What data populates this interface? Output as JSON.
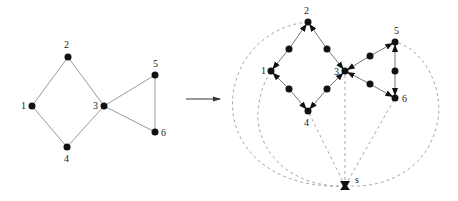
{
  "colors": {
    "edge": "#9a9a9a",
    "node": "#111111",
    "dashed": "#a8a8a8",
    "arrow": "#333333",
    "label": "#222222"
  },
  "left_graph": {
    "nodes": [
      {
        "id": "1",
        "label": "1",
        "x": 32,
        "y": 106,
        "lx": 21,
        "ly": 109
      },
      {
        "id": "2",
        "label": "2",
        "x": 68,
        "y": 57,
        "lx": 64,
        "ly": 48
      },
      {
        "id": "3",
        "label": "3",
        "x": 104,
        "y": 106,
        "lx": 93,
        "ly": 109
      },
      {
        "id": "4",
        "label": "4",
        "x": 67,
        "y": 147,
        "lx": 64,
        "ly": 162
      },
      {
        "id": "5",
        "label": "5",
        "x": 155,
        "y": 75,
        "lx": 153,
        "ly": 67
      },
      {
        "id": "6",
        "label": "6",
        "x": 155,
        "y": 132,
        "lx": 161,
        "ly": 136
      }
    ],
    "edges": [
      [
        "1",
        "2"
      ],
      [
        "2",
        "3"
      ],
      [
        "1",
        "4"
      ],
      [
        "4",
        "3"
      ],
      [
        "3",
        "5"
      ],
      [
        "3",
        "6"
      ],
      [
        "5",
        "6"
      ]
    ]
  },
  "transform_arrow": {
    "x1": 186,
    "y1": 99,
    "x2": 220,
    "y2": 99
  },
  "right_graph": {
    "nodes": [
      {
        "id": "1",
        "label": "1",
        "x": 271,
        "y": 71,
        "lx": 261,
        "ly": 74
      },
      {
        "id": "2",
        "label": "2",
        "x": 308,
        "y": 22,
        "lx": 304,
        "ly": 14
      },
      {
        "id": "3",
        "label": "3",
        "x": 345,
        "y": 71,
        "lx": 334,
        "ly": 75
      },
      {
        "id": "4",
        "label": "4",
        "x": 308,
        "y": 111,
        "lx": 304,
        "ly": 126
      },
      {
        "id": "5",
        "label": "5",
        "x": 395,
        "y": 42,
        "lx": 394,
        "ly": 34
      },
      {
        "id": "6",
        "label": "6",
        "x": 395,
        "y": 98,
        "lx": 402,
        "ly": 102
      },
      {
        "id": "s",
        "label": "s",
        "x": 345,
        "y": 186,
        "lx": 355,
        "ly": 183
      }
    ],
    "subdivision_nodes": [
      {
        "x": 289,
        "y": 49
      },
      {
        "x": 327,
        "y": 49
      },
      {
        "x": 289,
        "y": 89
      },
      {
        "x": 327,
        "y": 89
      },
      {
        "x": 370,
        "y": 56
      },
      {
        "x": 370,
        "y": 84
      },
      {
        "x": 395,
        "y": 71
      }
    ],
    "directed_edges": [
      {
        "from": [
          289,
          49
        ],
        "to": [
          271,
          71
        ]
      },
      {
        "from": [
          289,
          49
        ],
        "to": [
          308,
          22
        ]
      },
      {
        "from": [
          327,
          49
        ],
        "to": [
          308,
          22
        ]
      },
      {
        "from": [
          327,
          49
        ],
        "to": [
          345,
          71
        ]
      },
      {
        "from": [
          289,
          89
        ],
        "to": [
          271,
          71
        ]
      },
      {
        "from": [
          289,
          89
        ],
        "to": [
          308,
          111
        ]
      },
      {
        "from": [
          327,
          89
        ],
        "to": [
          308,
          111
        ]
      },
      {
        "from": [
          327,
          89
        ],
        "to": [
          345,
          71
        ]
      },
      {
        "from": [
          370,
          56
        ],
        "to": [
          345,
          71
        ]
      },
      {
        "from": [
          370,
          56
        ],
        "to": [
          395,
          42
        ]
      },
      {
        "from": [
          370,
          84
        ],
        "to": [
          345,
          71
        ]
      },
      {
        "from": [
          370,
          84
        ],
        "to": [
          395,
          98
        ]
      },
      {
        "from": [
          395,
          71
        ],
        "to": [
          395,
          42
        ]
      },
      {
        "from": [
          395,
          71
        ],
        "to": [
          395,
          98
        ]
      }
    ],
    "dashed_edges": [
      {
        "id": "s-2",
        "d": "M345,186 C250,190 210,120 245,60 C262,35 285,24 308,22"
      },
      {
        "id": "s-1",
        "d": "M345,186 C290,188 255,150 258,110 C260,92 265,80 271,71"
      },
      {
        "id": "s-4",
        "d": "M345,186 L308,111"
      },
      {
        "id": "s-3",
        "d": "M345,186 L345,71"
      },
      {
        "id": "s-6",
        "d": "M345,186 L395,98"
      },
      {
        "id": "s-5",
        "d": "M345,186 C420,190 450,130 435,85 C428,62 412,46 395,42"
      }
    ]
  }
}
